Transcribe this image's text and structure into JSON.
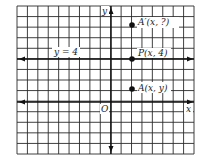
{
  "grid": {
    "left": 17,
    "top": 6,
    "right": 194,
    "bottom": 154,
    "cols": 17,
    "rows": 14,
    "line_color": "#2a2a2a",
    "axis_color": "#111111"
  },
  "axes": {
    "x_label": "x",
    "y_label": "y",
    "origin_label": "O",
    "origin_px": [
      111,
      102
    ]
  },
  "line": {
    "label": "y = 4",
    "y_value": 4
  },
  "points": [
    {
      "name": "A-prime",
      "label": "A′(x, ?)",
      "px": [
        132,
        25
      ]
    },
    {
      "name": "P",
      "label": "P(x, 4)",
      "px": [
        132,
        59
      ]
    },
    {
      "name": "A",
      "label": "A(x, y)",
      "px": [
        132,
        89
      ]
    }
  ]
}
